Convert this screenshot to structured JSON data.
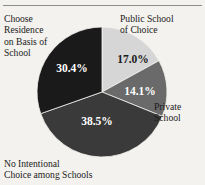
{
  "figure": {
    "background_color": "#f4f2ee",
    "rule_color": "#8d8d8d"
  },
  "chart_data": {
    "type": "pie",
    "title": "",
    "subtitle": "",
    "xlabel": "",
    "ylabel": "",
    "legend_position": "none",
    "grid": false,
    "units": "percent",
    "start_angle_deg": 0,
    "direction": "clockwise",
    "total": 100.0,
    "categories": [
      "Public School of Choice",
      "Private School",
      "No Intentional Choice among Schools",
      "Choose Residence on Basis of School"
    ],
    "values": [
      17.0,
      14.1,
      38.5,
      30.4
    ],
    "value_labels": [
      "17.0%",
      "14.1%",
      "38.5%",
      "30.4%"
    ],
    "colors": [
      "#d6d6d6",
      "#6a6a6a",
      "#3a3a3a",
      "#1a1a1a"
    ],
    "label_text_colors": [
      "#1b1b1b",
      "#ffffff",
      "#ffffff",
      "#ffffff"
    ],
    "slices": [
      {
        "name": "Public School of Choice",
        "value": 17.0,
        "value_label": "17.0%",
        "color": "#d6d6d6",
        "label_color": "#1b1b1b"
      },
      {
        "name": "Private School",
        "value": 14.1,
        "value_label": "14.1%",
        "color": "#6a6a6a",
        "label_color": "#ffffff"
      },
      {
        "name": "No Intentional Choice among Schools",
        "value": 38.5,
        "value_label": "38.5%",
        "color": "#3a3a3a",
        "label_color": "#ffffff"
      },
      {
        "name": "Choose Residence on Basis of School",
        "value": 30.4,
        "value_label": "30.4%",
        "color": "#1a1a1a",
        "label_color": "#ffffff"
      }
    ]
  },
  "labels": {
    "choose_residence": "Choose\nResidence\non Basis of\nSchool",
    "public_school": "Public School\nof Choice",
    "private_school": "Private\nSchool",
    "no_intentional": "No Intentional\nChoice among Schools"
  },
  "slice_values": {
    "public_school": "17.0%",
    "private_school": "14.1%",
    "no_intentional": "38.5%",
    "choose_residence": "30.4%"
  }
}
